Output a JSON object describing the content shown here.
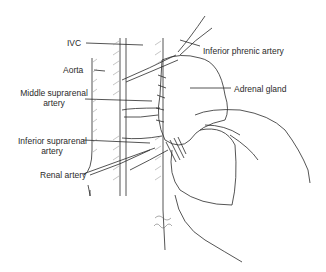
{
  "diagram": {
    "type": "anatomical-illustration",
    "labels": {
      "ivc": "IVC",
      "aorta": "Aorta",
      "middle_suprarenal_line1": "Middle suprarenal",
      "middle_suprarenal_line2": "artery",
      "inferior_suprarenal_line1": "Inferior suprarenal",
      "inferior_suprarenal_line2": "artery",
      "renal_artery": "Renal artery",
      "inferior_phrenic_artery": "Inferior phrenic artery",
      "adrenal_gland": "Adrenal gland"
    },
    "colors": {
      "ink": "#2a2a2a",
      "hatch": "#8a8a8a",
      "background": "#ffffff"
    }
  }
}
